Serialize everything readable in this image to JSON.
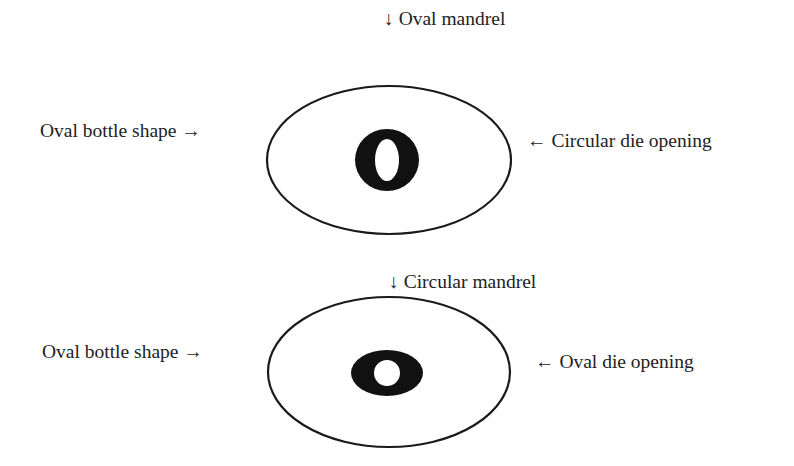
{
  "figures": [
    {
      "id": "top",
      "top_label": "↓ Oval mandrel",
      "left_label": "Oval bottle shape →",
      "right_label": "← Circular die opening",
      "outer": {
        "cx": 389,
        "cy": 160,
        "rx": 122,
        "ry": 74
      },
      "inner": {
        "type": "oval-ring",
        "cx": 387,
        "cy": 160,
        "rx": 32,
        "ry": 31,
        "hole_rx": 12,
        "hole_ry": 21
      }
    },
    {
      "id": "bottom",
      "top_label": "↓ Circular mandrel",
      "left_label": "Oval bottle shape →",
      "right_label": "← Oval die opening",
      "outer": {
        "cx": 389,
        "cy": 372,
        "rx": 121,
        "ry": 75
      },
      "inner": {
        "type": "oval-ring",
        "cx": 387,
        "cy": 373,
        "rx": 36,
        "ry": 23,
        "hole_rx": 13,
        "hole_ry": 13
      }
    }
  ],
  "colors": {
    "stroke": "#1a1a1a",
    "fill": "#111111",
    "text": "#222222"
  }
}
